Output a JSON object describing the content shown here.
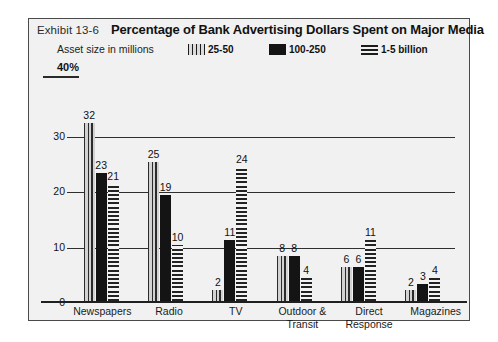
{
  "header": {
    "exhibit": "Exhibit 13-6",
    "title": "Percentage of Bank Advertising Dollars Spent on Major Media"
  },
  "legend": {
    "caption": "Asset size in millions",
    "items": [
      {
        "label": "25-50",
        "pattern": "vertical-stripes"
      },
      {
        "label": "100-250",
        "pattern": "solid-black"
      },
      {
        "label": "1-5 billion",
        "pattern": "horizontal-stripes"
      }
    ]
  },
  "axis": {
    "top_label": "40%",
    "ticks": [
      "30",
      "20",
      "10",
      "0"
    ]
  },
  "chart_data": {
    "type": "bar",
    "title": "Percentage of Bank Advertising Dollars Spent on Major Media",
    "xlabel": "",
    "ylabel": "",
    "ylim": [
      0,
      40
    ],
    "grid": true,
    "legend_position": "top",
    "legend_title": "Asset size in millions",
    "categories": [
      "Newspapers",
      "Radio",
      "TV",
      "Outdoor & Transit",
      "Direct Response",
      "Magazines"
    ],
    "series": [
      {
        "name": "25-50",
        "values": [
          32,
          25,
          2,
          8,
          6,
          2
        ]
      },
      {
        "name": "100-250",
        "values": [
          23,
          19,
          11,
          8,
          6,
          3
        ]
      },
      {
        "name": "1-5 billion",
        "values": [
          21,
          10,
          24,
          4,
          11,
          4
        ]
      }
    ]
  }
}
